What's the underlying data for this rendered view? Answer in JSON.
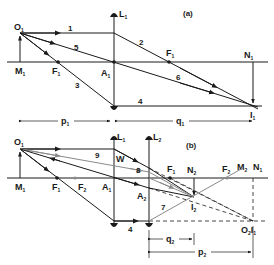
{
  "panel_a": {
    "tag": "(a)",
    "lens": {
      "label": "L",
      "sub": "1"
    },
    "points": {
      "object_top": {
        "label": "O",
        "sub": "1"
      },
      "object_base": {
        "label": "M",
        "sub": "1"
      },
      "focus_left": {
        "label": "F",
        "sub": "1"
      },
      "lens_center": {
        "label": "A",
        "sub": "1"
      },
      "focus_right": {
        "label": "F",
        "sub": "1"
      },
      "image_base": {
        "label": "N",
        "sub": "1"
      },
      "image_top": {
        "label": "I",
        "sub": "1"
      }
    },
    "rays": [
      "1",
      "2",
      "3",
      "4",
      "5",
      "6"
    ],
    "dimensions": {
      "object_distance": {
        "label": "p",
        "sub": "1"
      },
      "image_distance": {
        "label": "q",
        "sub": "1"
      }
    }
  },
  "panel_b": {
    "tag": "(b)",
    "lens1": {
      "label": "L",
      "sub": "1"
    },
    "lens2": {
      "label": "L",
      "sub": "2"
    },
    "points": {
      "object_top": {
        "label": "O",
        "sub": "1"
      },
      "object_base": {
        "label": "M",
        "sub": "1"
      },
      "focus1_left": {
        "label": "F",
        "sub": "1"
      },
      "focus2_left": {
        "label": "F",
        "sub": "2"
      },
      "lens1_center": {
        "label": "A",
        "sub": "1"
      },
      "lens2_center": {
        "label": "A",
        "sub": "2"
      },
      "w_point": {
        "label": "W"
      },
      "focus1_right": {
        "label": "F",
        "sub": "1"
      },
      "image2_base": {
        "label": "N",
        "sub": "2"
      },
      "image2_top": {
        "label": "I",
        "sub": "2"
      },
      "focus2_right": {
        "label": "F",
        "sub": "2"
      },
      "m2": {
        "label": "M",
        "sub": "2"
      },
      "n1": {
        "label": "N",
        "sub": "1"
      },
      "o2_i1": {
        "label": "O",
        "sub": "2",
        "label2": "I",
        "sub2": "1"
      }
    },
    "rays": [
      "4",
      "7",
      "8",
      "9"
    ],
    "dimensions": {
      "image_distance": {
        "label": "q",
        "sub": "2"
      },
      "object_distance": {
        "label": "p",
        "sub": "2"
      }
    }
  },
  "colors": {
    "ink": "#1a1a1a",
    "gray_ray": "#8a8a8a",
    "background": "#ffffff"
  }
}
